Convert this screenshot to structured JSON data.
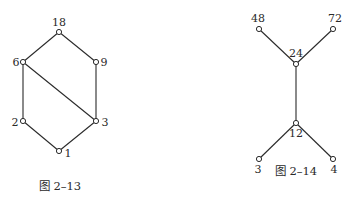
{
  "figures": [
    {
      "caption": "图 2–13",
      "caption_pos": [
        60,
        190
      ],
      "nodes": [
        {
          "id": "18",
          "label": "18",
          "x": 59,
          "y": 32,
          "lx": 59,
          "ly": 26,
          "anchor": "middle"
        },
        {
          "id": "6",
          "label": "6",
          "x": 23,
          "y": 62,
          "lx": 16,
          "ly": 66,
          "anchor": "middle"
        },
        {
          "id": "9",
          "label": "9",
          "x": 96,
          "y": 62,
          "lx": 104,
          "ly": 66,
          "anchor": "middle"
        },
        {
          "id": "2",
          "label": "2",
          "x": 23,
          "y": 121,
          "lx": 15,
          "ly": 126,
          "anchor": "middle"
        },
        {
          "id": "3",
          "label": "3",
          "x": 96,
          "y": 121,
          "lx": 105,
          "ly": 126,
          "anchor": "middle"
        },
        {
          "id": "1",
          "label": "1",
          "x": 59,
          "y": 151,
          "lx": 68,
          "ly": 157,
          "anchor": "middle"
        }
      ],
      "edges": [
        [
          "18",
          "6"
        ],
        [
          "18",
          "9"
        ],
        [
          "6",
          "2"
        ],
        [
          "6",
          "3"
        ],
        [
          "9",
          "3"
        ],
        [
          "2",
          "1"
        ],
        [
          "3",
          "1"
        ]
      ]
    },
    {
      "caption": "图 2–14",
      "caption_pos": [
        296,
        175
      ],
      "nodes": [
        {
          "id": "48",
          "label": "48",
          "x": 259,
          "y": 29,
          "lx": 258,
          "ly": 22,
          "anchor": "middle"
        },
        {
          "id": "72",
          "label": "72",
          "x": 333,
          "y": 29,
          "lx": 335,
          "ly": 22,
          "anchor": "middle"
        },
        {
          "id": "24",
          "label": "24",
          "x": 296,
          "y": 64,
          "lx": 296,
          "ly": 57,
          "anchor": "middle"
        },
        {
          "id": "12",
          "label": "12",
          "x": 296,
          "y": 123,
          "lx": 296,
          "ly": 137,
          "anchor": "middle"
        },
        {
          "id": "3",
          "label": "3",
          "x": 259,
          "y": 159,
          "lx": 258,
          "ly": 173,
          "anchor": "middle"
        },
        {
          "id": "4",
          "label": "4",
          "x": 333,
          "y": 159,
          "lx": 334,
          "ly": 173,
          "anchor": "middle"
        }
      ],
      "edges": [
        [
          "48",
          "24"
        ],
        [
          "72",
          "24"
        ],
        [
          "24",
          "12"
        ],
        [
          "12",
          "3"
        ],
        [
          "12",
          "4"
        ]
      ]
    }
  ]
}
